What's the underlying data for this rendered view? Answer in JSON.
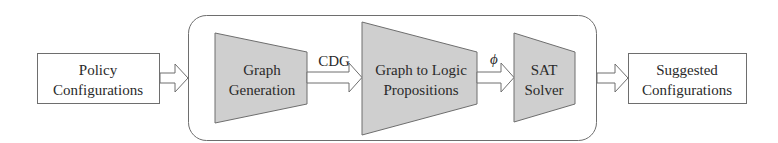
{
  "diagram": {
    "colors": {
      "stroke": "#6e6e6e",
      "fill_trapezoid": "#cfcfcf",
      "fill_box": "#ffffff",
      "text": "#2a2a2a"
    },
    "input_box": {
      "line1": "Policy",
      "line2": "Configurations"
    },
    "pipeline": {
      "stages": [
        {
          "line1": "Graph",
          "line2": "Generation"
        },
        {
          "line1": "Graph to Logic",
          "line2": "Propositions"
        },
        {
          "line1": "SAT",
          "line2": "Solver"
        }
      ],
      "edge_labels": [
        "CDG",
        "ϕ"
      ]
    },
    "output_box": {
      "line1": "Suggested",
      "line2": "Configurations"
    }
  }
}
